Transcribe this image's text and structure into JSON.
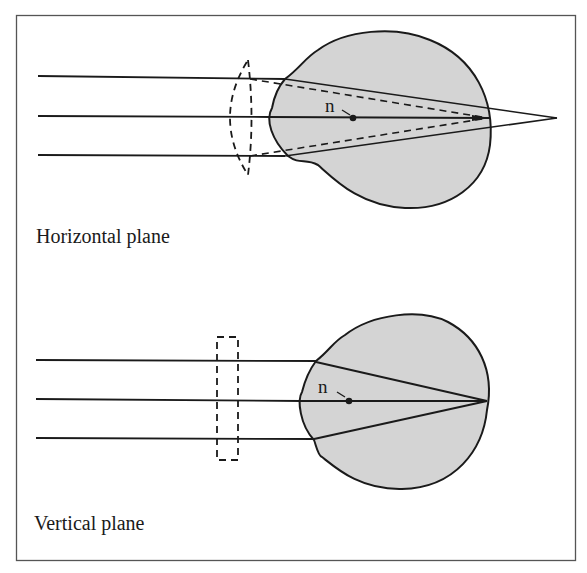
{
  "colors": {
    "eye_fill": "#d4d4d4",
    "stroke": "#1a1a1a",
    "frame": "#555555",
    "background": "#ffffff"
  },
  "panels": [
    {
      "name": "horizontal",
      "caption": "Horizontal plane",
      "nodal_label": "n",
      "corrective_lens": "cylindrical lens (curved, dashed) — refracting in this plane"
    },
    {
      "name": "vertical",
      "caption": "Vertical plane",
      "nodal_label": "n",
      "corrective_lens": "flat plate (rectangular, dashed) — no refraction in this plane"
    }
  ]
}
